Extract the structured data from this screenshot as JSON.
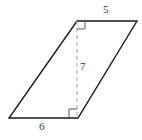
{
  "figure": {
    "kind": "parallelogram-with-height",
    "canvas": {
      "width": 142,
      "height": 140,
      "background": "#ffffff"
    },
    "style": {
      "edge_color": "#1a1a1a",
      "edge_width": 1.4,
      "height_line_color": "#b0b0b0",
      "height_line_width": 1.2,
      "height_line_dash": "4 3",
      "right_angle_color": "#555555",
      "right_angle_width": 1,
      "label_color": "#3a3a3a"
    },
    "vertices": {
      "bottom_left": {
        "x": 9,
        "y": 118
      },
      "bottom_right": {
        "x": 78,
        "y": 118
      },
      "top_right": {
        "x": 137,
        "y": 21
      },
      "top_left": {
        "x": 77,
        "y": 21
      }
    },
    "height_segment": {
      "from": {
        "x": 77,
        "y": 21
      },
      "to": {
        "x": 77,
        "y": 117
      }
    },
    "right_angle_markers": [
      {
        "name": "top-right-angle",
        "x": 77,
        "y": 21,
        "size": 8,
        "dir_x": 1,
        "dir_y": 1
      },
      {
        "name": "bottom-right-angle",
        "x": 77,
        "y": 117,
        "size": 8,
        "dir_x": -1,
        "dir_y": -1
      }
    ],
    "polygon_points": "9,118 78,118 137,21 77,21"
  },
  "labels": {
    "top_side": "5",
    "height": "7",
    "bottom_side": "6"
  }
}
